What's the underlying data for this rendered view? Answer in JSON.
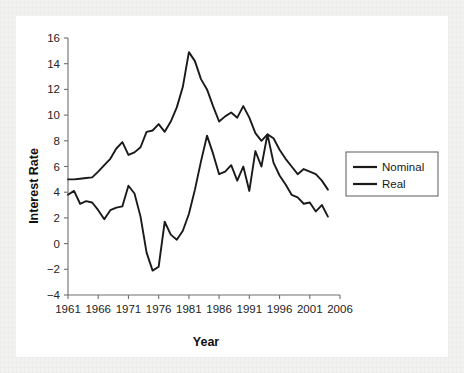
{
  "chart_data": {
    "type": "line",
    "title": "",
    "xlabel": "Year",
    "ylabel": "Interest Rate",
    "xlim": [
      1961,
      2006
    ],
    "ylim": [
      -4,
      16
    ],
    "xticks": [
      1961,
      1966,
      1971,
      1976,
      1981,
      1986,
      1991,
      1996,
      2001,
      2006
    ],
    "yticks": [
      -4,
      -2,
      0,
      2,
      4,
      6,
      8,
      10,
      12,
      14,
      16
    ],
    "grid": false,
    "legend_position": "right",
    "x": [
      1961,
      1962,
      1963,
      1964,
      1965,
      1966,
      1967,
      1968,
      1969,
      1970,
      1971,
      1972,
      1973,
      1974,
      1975,
      1976,
      1977,
      1978,
      1979,
      1980,
      1981,
      1982,
      1983,
      1984,
      1985,
      1986,
      1987,
      1988,
      1989,
      1990,
      1991,
      1992,
      1993,
      1994,
      1995,
      1996,
      1997,
      1998,
      1999,
      2000,
      2001,
      2002,
      2003,
      2004
    ],
    "series": [
      {
        "name": "Nominal",
        "values": [
          5.0,
          5.0,
          5.05,
          5.1,
          5.15,
          5.6,
          6.1,
          6.6,
          7.4,
          7.9,
          6.9,
          7.1,
          7.5,
          8.7,
          8.8,
          9.3,
          8.7,
          9.5,
          10.6,
          12.2,
          14.9,
          14.2,
          12.8,
          12.0,
          10.7,
          9.5,
          9.9,
          10.2,
          9.8,
          10.7,
          9.8,
          8.6,
          8.0,
          8.5,
          8.2,
          7.3,
          6.6,
          6.0,
          5.4,
          5.8,
          5.6,
          5.4,
          4.9,
          4.2
        ]
      },
      {
        "name": "Real",
        "values": [
          3.8,
          4.1,
          3.1,
          3.3,
          3.2,
          2.6,
          1.9,
          2.6,
          2.8,
          2.9,
          4.5,
          3.9,
          2.1,
          -0.7,
          -2.1,
          -1.8,
          1.7,
          0.7,
          0.3,
          1.0,
          2.3,
          4.2,
          6.4,
          8.4,
          7.0,
          5.4,
          5.6,
          6.1,
          4.9,
          6.0,
          4.1,
          7.2,
          6.0,
          8.5,
          6.3,
          5.3,
          4.6,
          3.8,
          3.6,
          3.1,
          3.2,
          2.5,
          3.0,
          2.1
        ]
      }
    ],
    "legend": [
      "Nominal",
      "Real"
    ],
    "colors": {
      "nominal": "#1a1a1a",
      "real": "#1a1a1a",
      "axis": "#6e6e6e",
      "background": "#ffffff"
    }
  }
}
